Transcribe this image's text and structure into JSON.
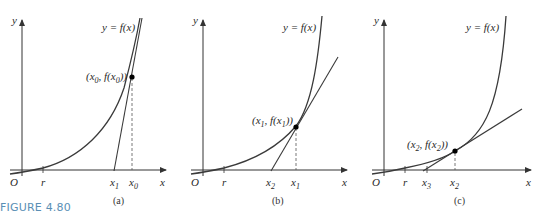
{
  "figure_label": "FIGURE 4.80",
  "axis_labels": {
    "x": "x",
    "y": "y",
    "origin": "O",
    "root": "r"
  },
  "curve_label": "y = f(x)",
  "panels": [
    {
      "caption": "(a)",
      "point_label": "(x0, f(x0))",
      "ticks": [
        "x1",
        "x0"
      ]
    },
    {
      "caption": "(b)",
      "point_label": "(x1, f(x1))",
      "ticks": [
        "x2",
        "x1"
      ]
    },
    {
      "caption": "(c)",
      "point_label": "(x2, f(x2))",
      "ticks": [
        "x3",
        "x2"
      ]
    }
  ],
  "colors": {
    "curve": "#3a3a3a",
    "figure_label": "#5a8fb5"
  }
}
